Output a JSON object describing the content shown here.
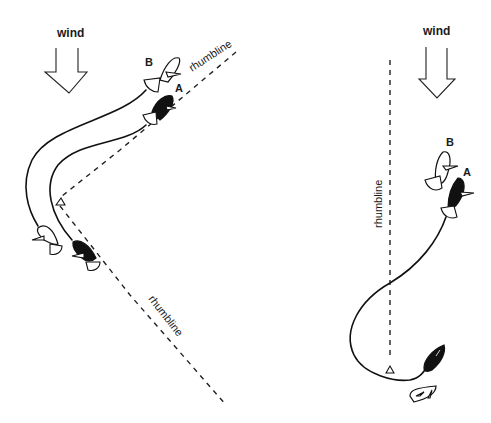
{
  "diagram": {
    "left": {
      "wind_label": "wind",
      "rhumbline_upper_label": "rhumbline",
      "rhumbline_lower_label": "rhumbline",
      "boat_b_label": "B",
      "boat_a_label": "A"
    },
    "right": {
      "wind_label": "wind",
      "rhumbline_label": "rhumbline",
      "boat_b_label": "B",
      "boat_a_label": "A"
    },
    "colors": {
      "ink": "#111111",
      "background": "#ffffff",
      "boat_a_fill": "#111111",
      "boat_b_fill": "#ffffff"
    }
  }
}
